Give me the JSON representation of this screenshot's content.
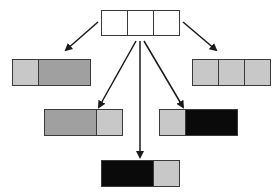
{
  "diagram": {
    "type": "tree of partitioned 3-cell bars",
    "colors": {
      "white": "#ffffff",
      "light_gray": "#c8c8c8",
      "dark_gray": "#a0a0a0",
      "black": "#0a0a0a",
      "stroke": "#3a3a3a",
      "arrow": "#1a1a1a"
    },
    "nodes": [
      {
        "id": "root",
        "x": 101,
        "y": 10,
        "w": 78,
        "h": 25,
        "cells": [
          {
            "span": 1,
            "fill": "white"
          },
          {
            "span": 1,
            "fill": "white"
          },
          {
            "span": 1,
            "fill": "white"
          }
        ]
      },
      {
        "id": "left",
        "x": 12,
        "y": 59,
        "w": 78,
        "h": 26,
        "cells": [
          {
            "span": 1,
            "fill": "light_gray"
          },
          {
            "span": 2,
            "fill": "dark_gray"
          }
        ]
      },
      {
        "id": "right",
        "x": 192,
        "y": 59,
        "w": 78,
        "h": 26,
        "cells": [
          {
            "span": 1,
            "fill": "light_gray"
          },
          {
            "span": 1,
            "fill": "light_gray"
          },
          {
            "span": 1,
            "fill": "light_gray"
          }
        ]
      },
      {
        "id": "mid-left",
        "x": 44,
        "y": 109,
        "w": 78,
        "h": 26,
        "cells": [
          {
            "span": 2,
            "fill": "dark_gray"
          },
          {
            "span": 1,
            "fill": "light_gray"
          }
        ]
      },
      {
        "id": "mid-right",
        "x": 159,
        "y": 109,
        "w": 78,
        "h": 26,
        "cells": [
          {
            "span": 1,
            "fill": "light_gray"
          },
          {
            "span": 2,
            "fill": "black"
          }
        ]
      },
      {
        "id": "bottom",
        "x": 101,
        "y": 160,
        "w": 78,
        "h": 26,
        "cells": [
          {
            "span": 2,
            "fill": "black"
          },
          {
            "span": 1,
            "fill": "light_gray"
          }
        ]
      }
    ],
    "edges": [
      {
        "from": "root",
        "to": "left",
        "x1": 98,
        "y1": 22,
        "x2": 66,
        "y2": 50
      },
      {
        "from": "root",
        "to": "right",
        "x1": 183,
        "y1": 22,
        "x2": 216,
        "y2": 50
      },
      {
        "from": "root",
        "to": "mid-left",
        "x1": 136,
        "y1": 41,
        "x2": 99,
        "y2": 107
      },
      {
        "from": "root",
        "to": "bottom",
        "x1": 140,
        "y1": 41,
        "x2": 140,
        "y2": 157
      },
      {
        "from": "root",
        "to": "mid-right",
        "x1": 144,
        "y1": 41,
        "x2": 183,
        "y2": 107
      }
    ]
  }
}
